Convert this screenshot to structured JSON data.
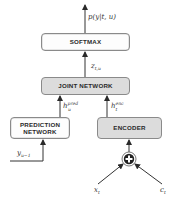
{
  "diagram": {
    "nodes": {
      "softmax": {
        "label": "SOFTMAX",
        "fill": "#fdfdfd"
      },
      "joint_network": {
        "label": "JOINT NETWORK",
        "fill": "#dcdcdc"
      },
      "prediction_network": {
        "label_line1": "PREDICTION",
        "label_line2": "NETWORK",
        "fill": "#fdfdfd"
      },
      "encoder": {
        "label": "ENCODER",
        "fill": "#dcdcdc"
      },
      "sum": {
        "symbol": "+"
      }
    },
    "edge_labels": {
      "output": {
        "base": "p(y|t, u)"
      },
      "joint_out": {
        "base": "z",
        "sub": "t,u"
      },
      "pred_out": {
        "base": "h",
        "sub": "u",
        "sup": "pred"
      },
      "enc_out": {
        "base": "h",
        "sub": "t",
        "sup": "enc"
      },
      "pred_in": {
        "base": "y",
        "sub": "u−1"
      },
      "input_x": {
        "base": "x",
        "sub": "t"
      },
      "input_c": {
        "base": "c",
        "sub": "t"
      }
    },
    "edges": [
      [
        "softmax",
        "output"
      ],
      [
        "joint_network",
        "softmax"
      ],
      [
        "prediction_network",
        "joint_network"
      ],
      [
        "encoder",
        "joint_network"
      ],
      [
        "pred_in",
        "prediction_network"
      ],
      [
        "sum",
        "encoder"
      ],
      [
        "input_x",
        "sum"
      ],
      [
        "input_c",
        "sum"
      ]
    ],
    "colors": {
      "line": "#333333",
      "border": "#8a8a8a",
      "gray_fill": "#dcdcdc"
    }
  }
}
